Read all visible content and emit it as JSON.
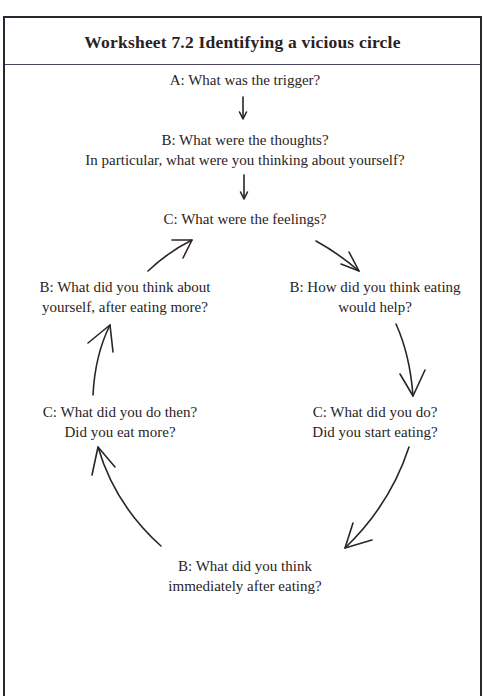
{
  "worksheet": {
    "title": "Worksheet 7.2 Identifying a vicious circle",
    "nodes": {
      "trigger": {
        "line1": "A: What was the trigger?"
      },
      "thoughts": {
        "line1": "B: What were the thoughts?",
        "line2": "In particular, what were you thinking about yourself?"
      },
      "feelings": {
        "line1": "C: What were the feelings?"
      },
      "eating_help": {
        "line1": "B: How did you think eating",
        "line2": "would help?"
      },
      "did_do": {
        "line1": "C: What did you do?",
        "line2": "Did you start eating?"
      },
      "after_eating": {
        "line1": "B: What did you think",
        "line2": "immediately after eating?"
      },
      "do_then": {
        "line1": "C: What did you do then?",
        "line2": "Did you eat more?"
      },
      "think_about_self": {
        "line1": "B: What did you think about",
        "line2": "yourself, after eating more?"
      }
    },
    "arrows": [
      {
        "name": "trigger-to-thoughts",
        "icon": "arrow-down"
      },
      {
        "name": "thoughts-to-feelings",
        "icon": "arrow-down"
      },
      {
        "name": "feelings-to-eating-help",
        "icon": "curved-arrow"
      },
      {
        "name": "eating-help-to-did-do",
        "icon": "curved-arrow"
      },
      {
        "name": "did-do-to-after-eating",
        "icon": "curved-arrow"
      },
      {
        "name": "after-eating-to-do-then",
        "icon": "curved-arrow"
      },
      {
        "name": "do-then-to-think-about-self",
        "icon": "curved-arrow"
      },
      {
        "name": "think-about-self-to-feelings",
        "icon": "curved-arrow"
      }
    ],
    "colors": {
      "border": "#2b2630",
      "text": "#2a2424",
      "divider": "#4a4560"
    }
  }
}
